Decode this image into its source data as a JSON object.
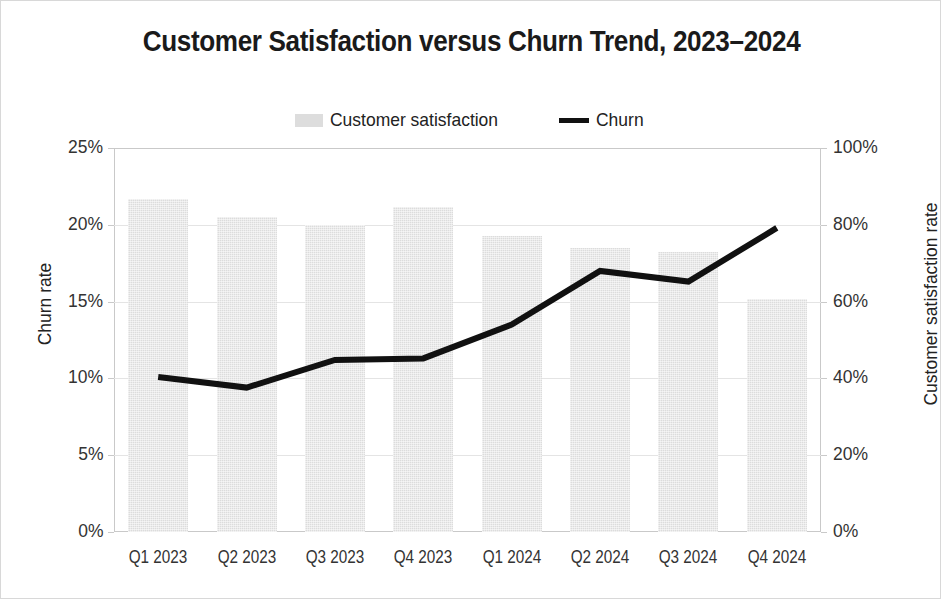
{
  "chart_data": {
    "type": "bar",
    "title": "Customer Satisfaction versus Churn Trend, 2023–2024",
    "categories": [
      "Q1 2023",
      "Q2 2023",
      "Q3 2023",
      "Q4 2023",
      "Q1 2024",
      "Q2 2024",
      "Q3 2024",
      "Q4 2024"
    ],
    "series": [
      {
        "name": "Customer satisfaction",
        "type": "bar",
        "axis": "right",
        "unit": "%",
        "color": "#dcdcdc",
        "values": [
          86.8,
          82.0,
          80.0,
          84.6,
          77.2,
          74.0,
          72.8,
          60.6
        ]
      },
      {
        "name": "Churn",
        "type": "line",
        "axis": "left",
        "unit": "%",
        "color": "#111111",
        "values": [
          10.1,
          9.4,
          11.2,
          11.3,
          13.5,
          17.0,
          16.3,
          19.8
        ]
      }
    ],
    "xlabel": "",
    "ylabel": "Churn rate",
    "ylabel_secondary": "Customer satisfaction rate",
    "ylim": [
      0,
      25
    ],
    "ylim_secondary": [
      0,
      100
    ],
    "yticks": [
      "0%",
      "5%",
      "10%",
      "15%",
      "20%",
      "25%"
    ],
    "ytick_values": [
      0,
      5,
      10,
      15,
      20,
      25
    ],
    "yticks_secondary": [
      "0%",
      "20%",
      "40%",
      "60%",
      "80%",
      "100%"
    ],
    "ytick_values_secondary": [
      0,
      20,
      40,
      60,
      80,
      100
    ],
    "grid": true,
    "legend_position": "top-center"
  },
  "legend": {
    "entries": [
      {
        "label": "Customer satisfaction",
        "marker": "swatch"
      },
      {
        "label": "Churn",
        "marker": "line"
      }
    ]
  }
}
